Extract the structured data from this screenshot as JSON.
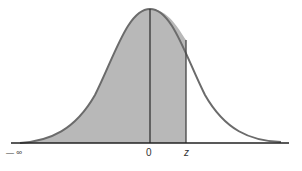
{
  "figure": {
    "type": "standard normal distribution curve",
    "shaded_region": "area under curve from -infinity to z",
    "labels": {
      "neg_infinity": "— ∞",
      "zero": "0",
      "z": "z"
    },
    "colors": {
      "shaded_fill": "#b8b8b8",
      "curve_stroke": "#6b6b6b",
      "axis_stroke": "#222222",
      "background": "#ffffff"
    }
  }
}
